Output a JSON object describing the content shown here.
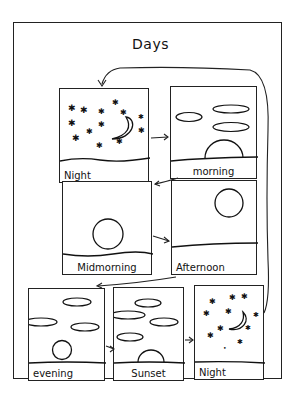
{
  "title": "Days",
  "panels": [
    {
      "id": "night-1",
      "label": "Night",
      "scene": "night"
    },
    {
      "id": "morning",
      "label": "morning",
      "scene": "sunrise"
    },
    {
      "id": "midmorning",
      "label": "Midmorning",
      "scene": "sun-low"
    },
    {
      "id": "afternoon",
      "label": "Afternoon",
      "scene": "sun-high"
    },
    {
      "id": "evening",
      "label": "evening",
      "scene": "sun-low-clouds"
    },
    {
      "id": "sunset",
      "label": "Sunset",
      "scene": "sunset"
    },
    {
      "id": "night-2",
      "label": "Night",
      "scene": "night"
    }
  ],
  "flow": [
    "Night",
    "morning",
    "Midmorning",
    "Afternoon",
    "evening",
    "Sunset",
    "Night"
  ],
  "colors": {
    "ink": "#222222",
    "paper": "#ffffff"
  }
}
